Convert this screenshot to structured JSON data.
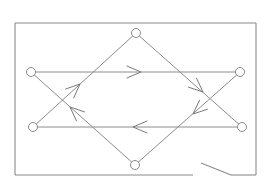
{
  "diagram": {
    "type": "circuit-flow-graph",
    "canvas": {
      "width": 274,
      "height": 188,
      "background": "#ffffff"
    },
    "colors": {
      "line": "#8c8c8c",
      "node_fill": "#ffffff",
      "node_stroke": "#8a8a8a"
    },
    "frame": {
      "segments": [
        {
          "id": "frame-left",
          "x1": 15,
          "y1": 23,
          "x2": 15,
          "y2": 175
        },
        {
          "id": "frame-top",
          "x1": 15,
          "y1": 23,
          "x2": 256,
          "y2": 23
        },
        {
          "id": "frame-right",
          "x1": 256,
          "y1": 23,
          "x2": 256,
          "y2": 175
        },
        {
          "id": "frame-bottom-left",
          "x1": 15,
          "y1": 175,
          "x2": 193,
          "y2": 175
        },
        {
          "id": "frame-bottom-right",
          "x1": 231,
          "y1": 175,
          "x2": 256,
          "y2": 175
        },
        {
          "id": "switch-blade",
          "x1": 201,
          "y1": 163,
          "x2": 231,
          "y2": 175
        }
      ]
    },
    "nodes": [
      {
        "id": "top",
        "cx": 136,
        "cy": 33,
        "r": 4.5
      },
      {
        "id": "left-upper",
        "cx": 31,
        "cy": 72,
        "r": 4.5
      },
      {
        "id": "right-upper",
        "cx": 240,
        "cy": 72,
        "r": 4.5
      },
      {
        "id": "left-lower",
        "cx": 33,
        "cy": 127,
        "r": 4.5
      },
      {
        "id": "right-lower",
        "cx": 242,
        "cy": 127,
        "r": 4.5
      },
      {
        "id": "bottom",
        "cx": 135,
        "cy": 165,
        "r": 4.5
      }
    ],
    "edges": [
      {
        "id": "upper-horizontal",
        "from": "left-upper",
        "to": "right-upper",
        "x1": 31,
        "y1": 72,
        "x2": 240,
        "y2": 72,
        "arrow": {
          "x": 141,
          "y": 72,
          "direction": "right"
        }
      },
      {
        "id": "top-to-right-lower",
        "from": "top",
        "to": "right-lower",
        "x1": 136,
        "y1": 33,
        "x2": 242,
        "y2": 127,
        "arrow": {
          "x": 203,
          "y": 92,
          "direction": "down-right"
        }
      },
      {
        "id": "right-upper-to-bottom",
        "from": "right-upper",
        "to": "bottom",
        "x1": 240,
        "y1": 72,
        "x2": 135,
        "y2": 165,
        "arrow": {
          "x": 193,
          "y": 114,
          "direction": "down-left"
        }
      },
      {
        "id": "lower-horizontal",
        "from": "right-lower",
        "to": "left-lower",
        "x1": 242,
        "y1": 127,
        "x2": 33,
        "y2": 127,
        "arrow": {
          "x": 133,
          "y": 127,
          "direction": "left"
        }
      },
      {
        "id": "bottom-to-left-upper",
        "from": "bottom",
        "to": "left-upper",
        "x1": 135,
        "y1": 165,
        "x2": 31,
        "y2": 72,
        "arrow": {
          "x": 70,
          "y": 107,
          "direction": "up-left"
        }
      },
      {
        "id": "left-lower-to-top",
        "from": "left-lower",
        "to": "top",
        "x1": 33,
        "y1": 127,
        "x2": 136,
        "y2": 33,
        "arrow": {
          "x": 80,
          "y": 84,
          "direction": "up-right"
        }
      }
    ]
  }
}
